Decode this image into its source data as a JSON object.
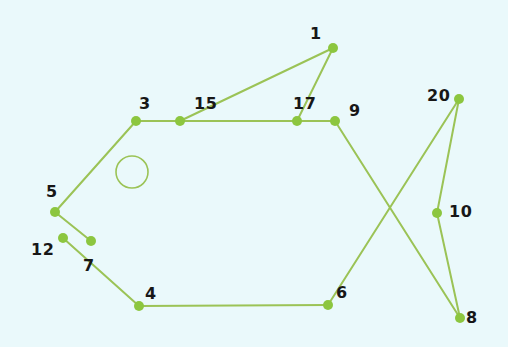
{
  "diagram": {
    "type": "node-link-graph",
    "background_color": "#eaf9fb",
    "edge_color": "#9ac martin",
    "stroke_color": "#9bc356",
    "node_fill_color": "#8cc63f",
    "label_color": "#171717",
    "canvas": {
      "width": 508,
      "height": 347
    },
    "node_radius": 5,
    "edge_width": 2,
    "nodes": [
      {
        "id": "1",
        "label": "1",
        "x": 333,
        "y": 48,
        "label_x": 310,
        "label_y": 26
      },
      {
        "id": "3",
        "label": "3",
        "x": 136,
        "y": 121,
        "label_x": 139,
        "label_y": 96
      },
      {
        "id": "15",
        "label": "15",
        "x": 180,
        "y": 121,
        "label_x": 194,
        "label_y": 96
      },
      {
        "id": "17",
        "label": "17",
        "x": 297,
        "y": 121,
        "label_x": 293,
        "label_y": 96
      },
      {
        "id": "9",
        "label": "9",
        "x": 335,
        "y": 121,
        "label_x": 349,
        "label_y": 103
      },
      {
        "id": "20",
        "label": "20",
        "x": 459,
        "y": 99,
        "label_x": 427,
        "label_y": 88
      },
      {
        "id": "10",
        "label": "10",
        "x": 437,
        "y": 213,
        "label_x": 449,
        "label_y": 204
      },
      {
        "id": "8",
        "label": "8",
        "x": 460,
        "y": 318,
        "label_x": 466,
        "label_y": 310
      },
      {
        "id": "6",
        "label": "6",
        "x": 328,
        "y": 305,
        "label_x": 336,
        "label_y": 285
      },
      {
        "id": "4",
        "label": "4",
        "x": 139,
        "y": 306,
        "label_x": 145,
        "label_y": 286
      },
      {
        "id": "5",
        "label": "5",
        "x": 55,
        "y": 212,
        "label_x": 46,
        "label_y": 184
      },
      {
        "id": "12",
        "label": "12",
        "x": 63,
        "y": 238,
        "label_x": 31,
        "label_y": 242
      },
      {
        "id": "7",
        "label": "7",
        "x": 91,
        "y": 241,
        "label_x": 83,
        "label_y": 258
      }
    ],
    "edges": [
      {
        "from": "3",
        "to": "15"
      },
      {
        "from": "15",
        "to": "17"
      },
      {
        "from": "17",
        "to": "9"
      },
      {
        "from": "15",
        "to": "1"
      },
      {
        "from": "17",
        "to": "1"
      },
      {
        "from": "3",
        "to": "5"
      },
      {
        "from": "5",
        "to": "7"
      },
      {
        "from": "12",
        "to": "4"
      },
      {
        "from": "4",
        "to": "6"
      },
      {
        "from": "9",
        "to": "8"
      },
      {
        "from": "20",
        "to": "6"
      },
      {
        "from": "20",
        "to": "10"
      },
      {
        "from": "10",
        "to": "8"
      }
    ],
    "shapes": [
      {
        "name": "eye-circle",
        "type": "circle",
        "cx": 132,
        "cy": 172,
        "r": 16
      }
    ]
  }
}
